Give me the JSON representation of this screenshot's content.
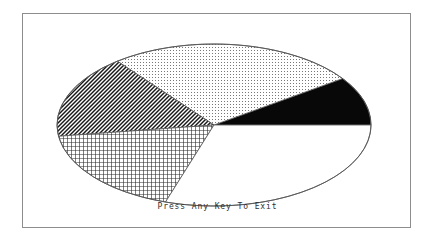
{
  "screen": {
    "background_color": "#ffffff",
    "frame_color": "#8d8d8d"
  },
  "caption": {
    "text": "Press Any Key To Exit"
  },
  "chart_data": {
    "type": "pie",
    "title": "",
    "subtitle": "",
    "xlabel": "",
    "ylabel": "",
    "grid": false,
    "legend_position": "none",
    "projection": "elliptical-2d",
    "center_x": 191,
    "center_y": 111,
    "radius_x": 157,
    "radius_y": 81,
    "start_angle_deg": 0,
    "direction": "counterclockwise",
    "outline_color": "#555555",
    "categories": [
      "Segment 1",
      "Segment 2",
      "Segment 3",
      "Segment 4",
      "Segment 5"
    ],
    "values": [
      9.7,
      25.8,
      16.7,
      17.8,
      30.0
    ],
    "angles_deg": [
      35,
      93,
      60,
      64,
      108
    ],
    "boundaries_deg": [
      0,
      35,
      128,
      188,
      252,
      360
    ],
    "fills": [
      "solid-black",
      "fine-dots",
      "diagonal-hatch",
      "cross-hatch",
      "blank-white"
    ],
    "colors": [
      "#000000",
      "#ffffff",
      "#ffffff",
      "#ffffff",
      "#ffffff"
    ],
    "annotations": []
  }
}
